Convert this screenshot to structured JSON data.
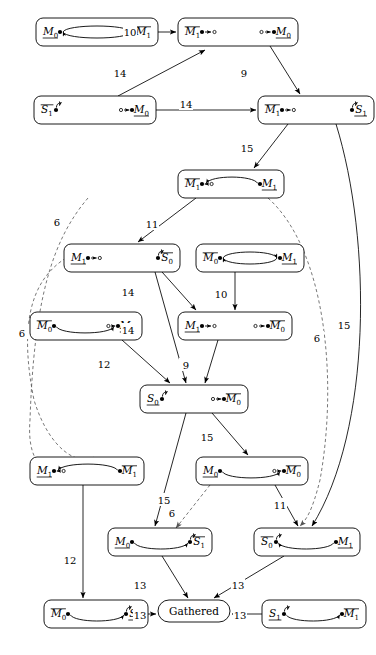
{
  "diagram": {
    "background": "#ffffff",
    "line_color": "#000000",
    "dashed_color": "#555555"
  },
  "nodes": [
    {
      "id": "n1",
      "name": "node-m0-m1bar-lens",
      "x": 36,
      "y": 18,
      "w": 122,
      "h": 28,
      "left": {
        "base": "M",
        "sub": "0",
        "bar": "under"
      },
      "right": {
        "base": "M",
        "sub": "1",
        "bar": "over"
      },
      "glyph": "lens-both-arrows"
    },
    {
      "id": "n2",
      "name": "node-m1bar-m0-split",
      "x": 178,
      "y": 18,
      "w": 120,
      "h": 28,
      "left": {
        "base": "M",
        "sub": "1",
        "bar": "over"
      },
      "right": {
        "base": "M",
        "sub": "0",
        "bar": "under"
      },
      "glyph": "split-outward"
    },
    {
      "id": "n3",
      "name": "node-s1bar-m0",
      "x": 34,
      "y": 96,
      "w": 122,
      "h": 28,
      "left": {
        "base": "S",
        "sub": "1",
        "bar": "over"
      },
      "right": {
        "base": "M",
        "sub": "0",
        "bar": "under"
      },
      "glyph": "selfloop-left-in-right"
    },
    {
      "id": "n4",
      "name": "node-m1bar-s1",
      "x": 258,
      "y": 96,
      "w": 116,
      "h": 28,
      "left": {
        "base": "M",
        "sub": "1",
        "bar": "over"
      },
      "right": {
        "base": "S",
        "sub": "1",
        "bar": "under"
      },
      "glyph": "out-left-selfloop-right"
    },
    {
      "id": "n5",
      "name": "node-m1bar-m1-arc",
      "x": 178,
      "y": 170,
      "w": 106,
      "h": 28,
      "left": {
        "base": "M",
        "sub": "1",
        "bar": "over"
      },
      "right": {
        "base": "M",
        "sub": "1",
        "bar": "under"
      },
      "glyph": "arc-up-left"
    },
    {
      "id": "n6",
      "name": "node-m1-s0bar",
      "x": 64,
      "y": 244,
      "w": 116,
      "h": 28,
      "left": {
        "base": "M",
        "sub": "1",
        "bar": "under"
      },
      "right": {
        "base": "S",
        "sub": "0",
        "bar": "over"
      },
      "glyph": "out-left-selfloop-right"
    },
    {
      "id": "n7",
      "name": "node-m0bar-m1-lens",
      "x": 196,
      "y": 244,
      "w": 108,
      "h": 28,
      "left": {
        "base": "M",
        "sub": "0",
        "bar": "over"
      },
      "right": {
        "base": "M",
        "sub": "1",
        "bar": "under"
      },
      "glyph": "lens-both-arrows"
    },
    {
      "id": "n8",
      "name": "node-m0bar-m0-arc",
      "x": 30,
      "y": 312,
      "w": 112,
      "h": 28,
      "left": {
        "base": "M",
        "sub": "0",
        "bar": "over"
      },
      "right": {
        "base": "M",
        "sub": "0",
        "bar": "under"
      },
      "glyph": "arc-down-right"
    },
    {
      "id": "n9",
      "name": "node-m1-m0bar-split",
      "x": 178,
      "y": 312,
      "w": 114,
      "h": 28,
      "left": {
        "base": "M",
        "sub": "1",
        "bar": "under"
      },
      "right": {
        "base": "M",
        "sub": "0",
        "bar": "over"
      },
      "glyph": "split-outward"
    },
    {
      "id": "n10",
      "name": "node-s0-m0bar",
      "x": 140,
      "y": 385,
      "w": 108,
      "h": 28,
      "left": {
        "base": "S",
        "sub": "0",
        "bar": "under"
      },
      "right": {
        "base": "M",
        "sub": "0",
        "bar": "over"
      },
      "glyph": "selfloop-left-in-right"
    },
    {
      "id": "n11",
      "name": "node-m1-m1bar-arc",
      "x": 30,
      "y": 457,
      "w": 114,
      "h": 28,
      "left": {
        "base": "M",
        "sub": "1",
        "bar": "under"
      },
      "right": {
        "base": "M",
        "sub": "1",
        "bar": "over"
      },
      "glyph": "arc-up-left"
    },
    {
      "id": "n12",
      "name": "node-m0-m0bar-arc",
      "x": 196,
      "y": 457,
      "w": 112,
      "h": 28,
      "left": {
        "base": "M",
        "sub": "0",
        "bar": "under"
      },
      "right": {
        "base": "M",
        "sub": "0",
        "bar": "over"
      },
      "glyph": "arc-down-right"
    },
    {
      "id": "n13",
      "name": "node-m0-s1bar-arc",
      "x": 108,
      "y": 528,
      "w": 104,
      "h": 28,
      "left": {
        "base": "M",
        "sub": "0",
        "bar": "under"
      },
      "right": {
        "base": "S",
        "sub": "1",
        "bar": "over"
      },
      "glyph": "arc-down-right-loop"
    },
    {
      "id": "n14",
      "name": "node-s0bar-m1-arc",
      "x": 254,
      "y": 528,
      "w": 106,
      "h": 28,
      "left": {
        "base": "S",
        "sub": "0",
        "bar": "over"
      },
      "right": {
        "base": "M",
        "sub": "1",
        "bar": "under"
      },
      "glyph": "arc-up-left-loop"
    },
    {
      "id": "n15",
      "name": "node-m0bar-s0-arc",
      "x": 44,
      "y": 600,
      "w": 104,
      "h": 28,
      "left": {
        "base": "M",
        "sub": "0",
        "bar": "over"
      },
      "right": {
        "base": "S",
        "sub": "0",
        "bar": "under"
      },
      "glyph": "arc-down-right-loop"
    },
    {
      "id": "n16",
      "name": "node-s1-m1bar-arc",
      "x": 262,
      "y": 600,
      "w": 104,
      "h": 28,
      "left": {
        "base": "S",
        "sub": "1",
        "bar": "under"
      },
      "right": {
        "base": "M",
        "sub": "1",
        "bar": "over"
      },
      "glyph": "arc-down-right-loop2"
    },
    {
      "id": "gathered",
      "name": "node-gathered",
      "x": 158,
      "y": 600,
      "w": 72,
      "h": 22,
      "label": "Gathered",
      "glyph": "none"
    }
  ],
  "edges": [
    {
      "name": "edge-n1-n2",
      "label": "10",
      "x": 130,
      "y": 32,
      "style": "solid"
    },
    {
      "name": "edge-n3-n2",
      "label": "14",
      "x": 120,
      "y": 73,
      "style": "solid"
    },
    {
      "name": "edge-n2-n4",
      "label": "9",
      "x": 244,
      "y": 73,
      "style": "solid"
    },
    {
      "name": "edge-n3-n4",
      "label": "14",
      "x": 186,
      "y": 104,
      "style": "solid"
    },
    {
      "name": "edge-n4-n5",
      "label": "15",
      "x": 247,
      "y": 148,
      "style": "solid"
    },
    {
      "name": "edge-n5-n6",
      "label": "11",
      "x": 152,
      "y": 224,
      "style": "solid"
    },
    {
      "name": "edge-n6-n9",
      "label": "14",
      "x": 128,
      "y": 292,
      "style": "solid"
    },
    {
      "name": "edge-n7-n9",
      "label": "10",
      "x": 221,
      "y": 294,
      "style": "solid"
    },
    {
      "name": "edge-n6-n10",
      "label": "14",
      "x": 128,
      "y": 330,
      "style": "solid"
    },
    {
      "name": "edge-n9-n10",
      "label": "9",
      "x": 186,
      "y": 365,
      "style": "solid"
    },
    {
      "name": "edge-n8-n10",
      "label": "12",
      "x": 104,
      "y": 364,
      "style": "solid"
    },
    {
      "name": "edge-n10-n12",
      "label": "15",
      "x": 207,
      "y": 437,
      "style": "solid"
    },
    {
      "name": "edge-n10-n13",
      "label": "15",
      "x": 164,
      "y": 500,
      "style": "solid"
    },
    {
      "name": "edge-n11-n15",
      "label": "12",
      "x": 70,
      "y": 560,
      "style": "solid"
    },
    {
      "name": "edge-n13-gathered",
      "label": "13",
      "x": 140,
      "y": 585,
      "style": "solid"
    },
    {
      "name": "edge-n14-gathered",
      "label": "13",
      "x": 238,
      "y": 585,
      "style": "solid"
    },
    {
      "name": "edge-n15-gathered",
      "label": "13",
      "x": 140,
      "y": 615,
      "style": "solid"
    },
    {
      "name": "edge-n16-gathered",
      "label": "13",
      "x": 240,
      "y": 615,
      "style": "solid"
    },
    {
      "name": "edge-n12-n14",
      "label": "11",
      "x": 280,
      "y": 505,
      "style": "solid"
    },
    {
      "name": "edge-n4-n14-curve",
      "label": "15",
      "x": 344,
      "y": 325,
      "style": "solid"
    },
    {
      "name": "edge-dashed-left-upper",
      "label": "6",
      "x": 57,
      "y": 222,
      "style": "dashed"
    },
    {
      "name": "edge-dashed-left-lower",
      "label": "6",
      "x": 22,
      "y": 333,
      "style": "dashed"
    },
    {
      "name": "edge-dashed-right",
      "label": "6",
      "x": 317,
      "y": 338,
      "style": "dashed"
    },
    {
      "name": "edge-dashed-n12-n13",
      "label": "6",
      "x": 172,
      "y": 513,
      "style": "dashed"
    }
  ]
}
